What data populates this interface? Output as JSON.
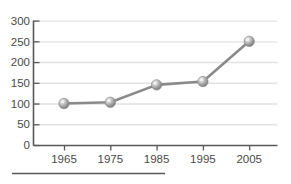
{
  "chart_data": {
    "type": "line",
    "title": "",
    "subtitle": "",
    "xlabel": "",
    "ylabel": "",
    "categories": [
      "1965",
      "1975",
      "1985",
      "1995",
      "2005"
    ],
    "x": [
      1965,
      1975,
      1985,
      1995,
      2005
    ],
    "values": [
      100,
      103,
      145,
      153,
      250
    ],
    "series": [
      {
        "name": "",
        "values": [
          100,
          103,
          145,
          153,
          250
        ]
      }
    ],
    "ylim": [
      0,
      300
    ],
    "yticks": [
      0,
      50,
      100,
      150,
      200,
      250,
      300
    ],
    "ytick_labels": [
      "0",
      "50",
      "100",
      "150",
      "200",
      "250",
      "300"
    ],
    "xtick_labels": [
      "1965",
      "1975",
      "1985",
      "1995",
      "2005"
    ],
    "grid": "horizontal",
    "legend": "none",
    "marker": "sphere",
    "colors": {
      "line": "#8a8a8a",
      "marker": "#9a9a9a",
      "marker_highlight": "#e8e8e8",
      "axis": "#595959",
      "gridline": "#e2e2e2",
      "tick_text": "#4a4a4a",
      "footer_rule": "#595959",
      "background": "#ffffff"
    }
  },
  "footer": {
    "rule_label": "footer-rule"
  }
}
